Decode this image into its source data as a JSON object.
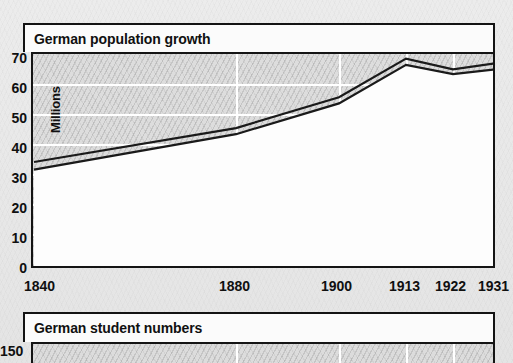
{
  "chart_data": [
    {
      "type": "line",
      "title": "German population growth",
      "xlabel": "",
      "ylabel": "Millions",
      "ylim": [
        0,
        70
      ],
      "yticks": [
        0,
        10,
        20,
        30,
        40,
        50,
        60,
        70
      ],
      "xticks": [
        "1840",
        "1880",
        "1900",
        "1913",
        "1922",
        "1931"
      ],
      "grid": true,
      "legend": "none",
      "x": [
        1840,
        1880,
        1900,
        1913,
        1922,
        1931
      ],
      "series": [
        {
          "name": "upper band",
          "values": [
            35,
            46,
            56,
            68.5,
            65,
            67
          ]
        },
        {
          "name": "lower band",
          "values": [
            32.5,
            44,
            54,
            66.5,
            63.5,
            65
          ]
        }
      ]
    },
    {
      "type": "line",
      "title": "German student numbers",
      "ylabel": "",
      "yticks": [
        150
      ],
      "ytick_labels": [
        "150"
      ],
      "note": "chart cropped at bottom edge of screenshot"
    }
  ],
  "fig1": {
    "title": "German population growth",
    "axis_label": "Millions",
    "yticks": [
      {
        "label": "70",
        "value": 70
      },
      {
        "label": "60",
        "value": 60
      },
      {
        "label": "50",
        "value": 50
      },
      {
        "label": "40",
        "value": 40
      },
      {
        "label": "30",
        "value": 30
      },
      {
        "label": "20",
        "value": 20
      },
      {
        "label": "10",
        "value": 10
      },
      {
        "label": "0",
        "value": 0
      }
    ],
    "xticks": [
      {
        "label": "1840",
        "value": 1840
      },
      {
        "label": "1880",
        "value": 1880
      },
      {
        "label": "1900",
        "value": 1900
      },
      {
        "label": "1913",
        "value": 1913
      },
      {
        "label": "1922",
        "value": 1922
      },
      {
        "label": "1931",
        "value": 1931
      }
    ]
  },
  "fig2": {
    "title": "German student numbers",
    "yticks": [
      {
        "label": "150",
        "value": 150
      }
    ]
  },
  "colors": {
    "ink": "#131313",
    "paper": "#ececec",
    "plot_bg": "#fdfdfd",
    "band_fill": "#dddddd",
    "gridline": "#ffffff"
  }
}
